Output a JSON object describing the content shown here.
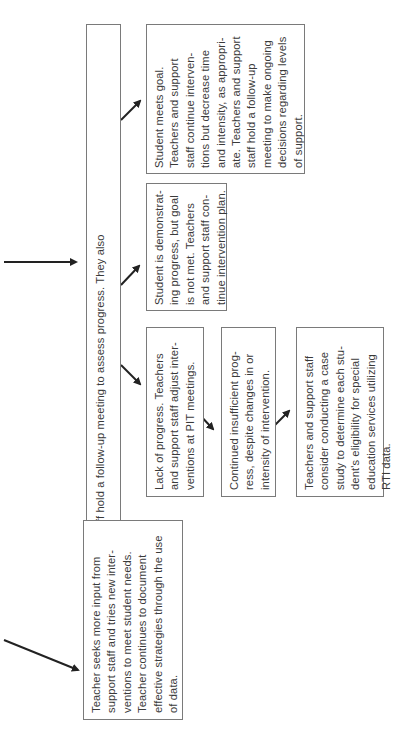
{
  "diagram": {
    "orientation": "rotated-90-ccw",
    "top_box": {
      "lines": [
        "Teachers and support staff hold a follow-up meeting to assess progress. They also",
        "invite parents."
      ]
    },
    "left_box": {
      "lines": [
        "Teacher seeks more input from",
        "support staff and tries new inter-",
        "ventions to meet student needs.",
        "Teacher continues to document",
        "effective strategies through the use",
        "of data."
      ]
    },
    "outcome_lack": {
      "lines": [
        "Lack of progress. Teachers",
        "and support staff adjust inter-",
        "ventions at PIT meetings."
      ]
    },
    "outcome_insufficient": {
      "lines": [
        "Continued insufficient prog-",
        "ress, despite changes in or",
        "intensity of intervention."
      ]
    },
    "outcome_case_study": {
      "lines": [
        "Teachers and support staff",
        "consider conducting a case",
        "study to determine each stu-",
        "dent's eligibility for special",
        "education services utilizing",
        "RTI data."
      ]
    },
    "outcome_demonstrating": {
      "lines": [
        "Student is demonstrat-",
        "ing progress, but goal",
        "is not met. Teachers",
        "and support staff con-",
        "tinue intervention plan."
      ]
    },
    "outcome_meets_goal": {
      "lines": [
        "Student meets goal.",
        "Teachers and support",
        "staff continue interven-",
        "tions but decrease time",
        "and intensity, as appropri-",
        "ate. Teachers and support",
        "staff hold a follow-up",
        "meeting to make ongoing",
        "decisions regarding levels",
        "of support."
      ]
    },
    "arrow_color": "#222222",
    "border_color": "#7a7a7a"
  }
}
